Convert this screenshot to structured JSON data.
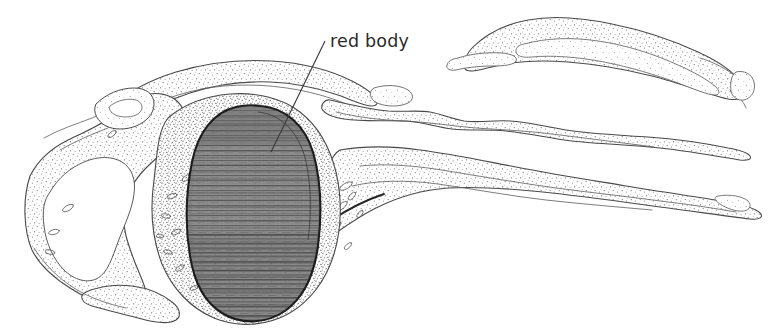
{
  "figure": {
    "kind": "anatomical-line-drawing",
    "background_color": "#ffffff",
    "ink_color": "#2a2a2a",
    "width": 772,
    "height": 332
  },
  "annotations": [
    {
      "id": "red-body",
      "label": "red body",
      "label_x": 330,
      "label_y": 47,
      "leader_from_x": 325,
      "leader_from_y": 41,
      "leader_to_x": 271,
      "leader_to_y": 152
    }
  ],
  "structures": {
    "red_body": {
      "name": "red body",
      "fill_color": "#8d8d8d",
      "outline_color": "#1d1d1d",
      "texture": "horizontal-striations"
    },
    "surrounding_tissue": {
      "name": "surrounding tissue",
      "fill_color": "#fbfbfb",
      "texture": "stipple",
      "outline_color": "#4a4a4a"
    },
    "lumen": {
      "name": "lumen cavity",
      "fill_color": "#ffffff",
      "texture": "none"
    }
  }
}
